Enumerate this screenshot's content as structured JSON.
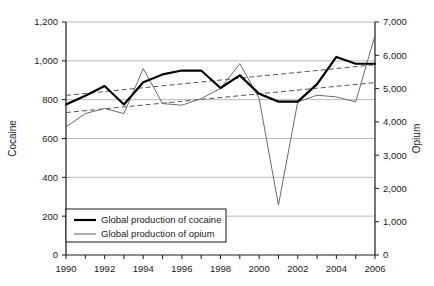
{
  "chart_data": {
    "type": "line",
    "title": "",
    "xlabel": "",
    "ylabel": "Cocaine",
    "y2label": "Opium",
    "grid": true,
    "legend_position": "bottom-left",
    "x": [
      1990,
      1991,
      1992,
      1993,
      1994,
      1995,
      1996,
      1997,
      1998,
      1999,
      2000,
      2001,
      2002,
      2003,
      2004,
      2005,
      2006
    ],
    "xlim": [
      1990,
      2006
    ],
    "xticks": [
      "1990",
      "1992",
      "1994",
      "1996",
      "1998",
      "2000",
      "2002",
      "2004",
      "2006"
    ],
    "ylim": [
      0,
      1200
    ],
    "yticks": [
      "0",
      "200",
      "400",
      "600",
      "800",
      "1,000",
      "1,200"
    ],
    "y2lim": [
      0,
      7000
    ],
    "y2ticks": [
      "0",
      "1,000",
      "2,000",
      "3,000",
      "4,000",
      "5,000",
      "6,000",
      "7,000"
    ],
    "series": [
      {
        "name": "Global production of cocaine",
        "axis": "left",
        "color": "#000000",
        "width": 2.2,
        "style": "solid",
        "values": [
          775,
          820,
          870,
          775,
          890,
          930,
          950,
          950,
          860,
          925,
          830,
          790,
          790,
          880,
          1020,
          985,
          985
        ]
      },
      {
        "name": "Global production of opium",
        "axis": "right",
        "color": "#6b6b6b",
        "width": 1.0,
        "style": "solid",
        "values": [
          3850,
          4250,
          4400,
          4250,
          5600,
          4550,
          4500,
          4700,
          5000,
          5750,
          4700,
          1500,
          4600,
          4800,
          4750,
          4600,
          6600
        ]
      }
    ],
    "trendlines": [
      {
        "name": "cocaine-trendline",
        "axis": "left",
        "color": "#555555",
        "style": "dashed",
        "start": [
          1990,
          822
        ],
        "end": [
          2006,
          980
        ]
      },
      {
        "name": "opium-trendline",
        "axis": "right",
        "color": "#555555",
        "style": "dashed",
        "start": [
          1990,
          4280
        ],
        "end": [
          2006,
          5180
        ]
      }
    ]
  },
  "legend": {
    "items": [
      {
        "label": "Global production of cocaine",
        "color": "#000000",
        "width": 2.2
      },
      {
        "label": "Global production of opium",
        "color": "#8a8a8a",
        "width": 1.4
      }
    ]
  },
  "axes": {
    "left_title": "Cocaine",
    "right_title": "Opium"
  }
}
